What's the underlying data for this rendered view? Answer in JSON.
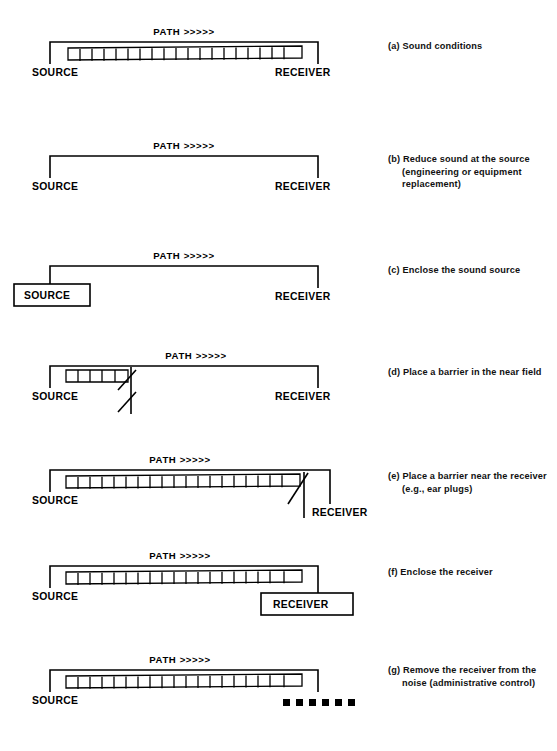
{
  "figure": {
    "line_color": "#000000",
    "background_color": "#ffffff",
    "path_label": "PATH >>>>>",
    "source_label": "SOURCE",
    "receiver_label": "RECEIVER"
  },
  "panels": [
    {
      "id": "a",
      "marker": "(a)",
      "caption": "Sound conditions",
      "path_label": "PATH >>>>>",
      "source_label": "SOURCE",
      "receiver_label": "RECEIVER",
      "hatch": "full",
      "hatch_cells": 19,
      "source_boxed": false,
      "receiver_boxed": false,
      "receiver_visible": true,
      "barrier": "none",
      "dashes": 0
    },
    {
      "id": "b",
      "marker": "(b)",
      "caption": "Reduce sound at the source (engineering or equipment replacement)",
      "path_label": "PATH >>>>>",
      "source_label": "SOURCE",
      "receiver_label": "RECEIVER",
      "hatch": "none",
      "hatch_cells": 0,
      "source_boxed": false,
      "receiver_boxed": false,
      "receiver_visible": true,
      "barrier": "none",
      "dashes": 0
    },
    {
      "id": "c",
      "marker": "(c)",
      "caption": "Enclose the sound source",
      "path_label": "PATH >>>>>",
      "source_label": "SOURCE",
      "receiver_label": "RECEIVER",
      "hatch": "none",
      "hatch_cells": 0,
      "source_boxed": true,
      "receiver_boxed": false,
      "receiver_visible": true,
      "barrier": "none",
      "dashes": 0
    },
    {
      "id": "d",
      "marker": "(d)",
      "caption": "Place a barrier in the near field",
      "path_label": "PATH >>>>>",
      "source_label": "SOURCE",
      "receiver_label": "RECEIVER",
      "hatch": "short",
      "hatch_cells": 5,
      "source_boxed": false,
      "receiver_boxed": false,
      "receiver_visible": true,
      "barrier": "near-source",
      "dashes": 0
    },
    {
      "id": "e",
      "marker": "(e)",
      "caption": "Place a barrier near the receiver (e.g., ear plugs)",
      "path_label": "PATH >>>>>",
      "source_label": "SOURCE",
      "receiver_label": "RECEIVER",
      "hatch": "full",
      "hatch_cells": 19,
      "source_boxed": false,
      "receiver_boxed": false,
      "receiver_visible": true,
      "barrier": "near-receiver",
      "dashes": 0
    },
    {
      "id": "f",
      "marker": "(f)",
      "caption": "Enclose the receiver",
      "path_label": "PATH >>>>>",
      "source_label": "SOURCE",
      "receiver_label": "RECEIVER",
      "hatch": "full",
      "hatch_cells": 19,
      "source_boxed": false,
      "receiver_boxed": true,
      "receiver_visible": true,
      "barrier": "none",
      "dashes": 0
    },
    {
      "id": "g",
      "marker": "(g)",
      "caption": "Remove the receiver from the noise (administrative control)",
      "path_label": "PATH >>>>>",
      "source_label": "SOURCE",
      "receiver_label": "",
      "hatch": "full",
      "hatch_cells": 19,
      "source_boxed": false,
      "receiver_boxed": false,
      "receiver_visible": false,
      "barrier": "none",
      "dashes": 6
    }
  ]
}
